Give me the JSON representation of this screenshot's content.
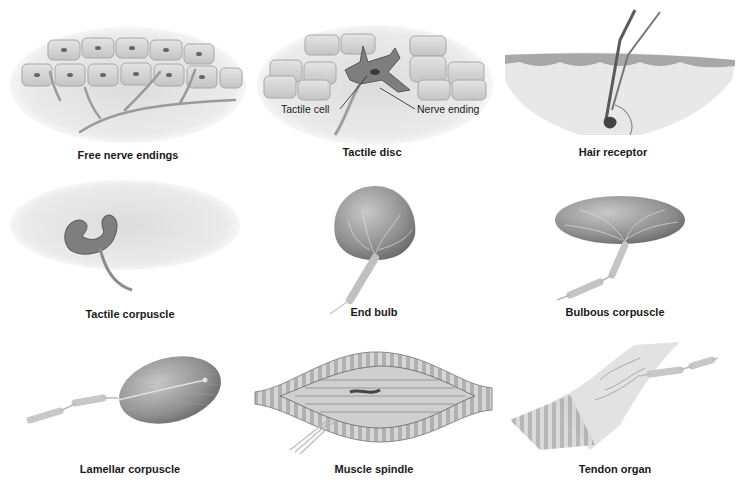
{
  "panels": [
    {
      "id": "free-nerve-endings",
      "caption": "Free nerve endings"
    },
    {
      "id": "tactile-disc",
      "caption": "Tactile disc",
      "callouts": [
        "Tactile cell",
        "Nerve ending"
      ]
    },
    {
      "id": "hair-receptor",
      "caption": "Hair receptor"
    },
    {
      "id": "tactile-corpuscle",
      "caption": "Tactile corpuscle"
    },
    {
      "id": "end-bulb",
      "caption": "End bulb"
    },
    {
      "id": "bulbous-corpuscle",
      "caption": "Bulbous corpuscle"
    },
    {
      "id": "lamellar-corpuscle",
      "caption": "Lamellar corpuscle"
    },
    {
      "id": "muscle-spindle",
      "caption": "Muscle spindle"
    },
    {
      "id": "tendon-organ",
      "caption": "Tendon organ"
    }
  ],
  "colors": {
    "tissue": "#e6e6e6",
    "cell": "#d2d2d2",
    "dark": "#7a7a7a",
    "capsule": "#9a9a9a",
    "caption": "#1a1a1a"
  }
}
